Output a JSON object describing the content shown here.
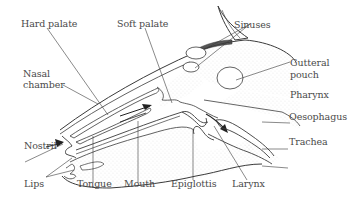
{
  "diagram": {
    "labels": {
      "hard_palate": "Hard palate",
      "soft_palate": "Soft palate",
      "sinuses": "Sinuses",
      "gutteral_pouch_1": "Gutteral",
      "gutteral_pouch_2": "pouch",
      "nasal_chamber_1": "Nasal",
      "nasal_chamber_2": "chamber",
      "pharynx": "Pharynx",
      "oesophagus": "Oesophagus",
      "trachea": "Trachea",
      "nostril": "Nostril",
      "lips": "Lips",
      "tongue": "Tongue",
      "mouth": "Mouth",
      "epiglottis": "Epiglottis",
      "larynx": "Larynx"
    },
    "colors": {
      "line": "#3a3a3a",
      "stipple": "#9a9a9a",
      "text": "#4a4a4a",
      "background": "#ffffff"
    }
  }
}
